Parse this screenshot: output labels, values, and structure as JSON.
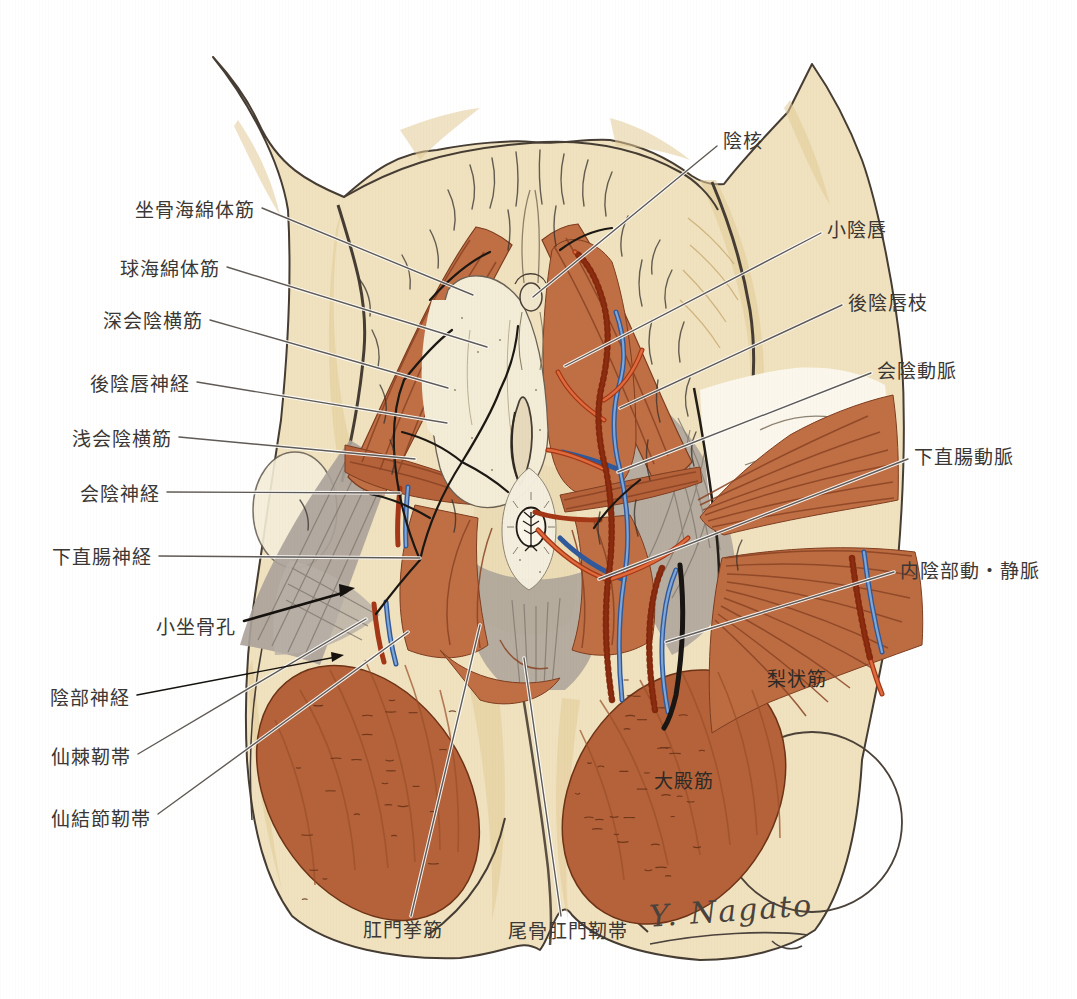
{
  "figure": {
    "kind": "anatomical illustration, female perineum (lithotomy view)",
    "signature": "Y. Nagato"
  },
  "palette": {
    "background": "#ffffff",
    "skin": "#f0e2bf",
    "skin_shade": "#e3cb97",
    "outline": "#453c33",
    "muscle": "#c06f44",
    "muscle_stria": "#8a4324",
    "gluteus": "#b5623a",
    "fascia_gray": "#aba29a",
    "artery_red": "#b33c1d",
    "vein_blue": "#3f6ca8",
    "nerve_black": "#1b1713",
    "label_text": "#3a3734",
    "leader_line": "#5f5a55"
  },
  "labels": {
    "left": [
      {
        "text": "坐骨海綿体筋"
      },
      {
        "text": "球海綿体筋"
      },
      {
        "text": "深会陰横筋"
      },
      {
        "text": "後陰唇神経"
      },
      {
        "text": "浅会陰横筋"
      },
      {
        "text": "会陰神経"
      },
      {
        "text": "下直腸神経"
      },
      {
        "text": "小坐骨孔"
      },
      {
        "text": "陰部神経"
      },
      {
        "text": "仙棘靭帯"
      },
      {
        "text": "仙結節靭帯"
      }
    ],
    "right": [
      {
        "text": "陰核"
      },
      {
        "text": "小陰唇"
      },
      {
        "text": "後陰唇枝"
      },
      {
        "text": "会陰動脈"
      },
      {
        "text": "下直腸動脈"
      },
      {
        "text": "内陰部動・静脈"
      }
    ],
    "muscle_overlay": [
      {
        "text": "梨状筋"
      },
      {
        "text": "大殿筋"
      }
    ],
    "bottom": [
      {
        "text": "肛門挙筋"
      },
      {
        "text": "尾骨肛門靭帯"
      }
    ]
  }
}
